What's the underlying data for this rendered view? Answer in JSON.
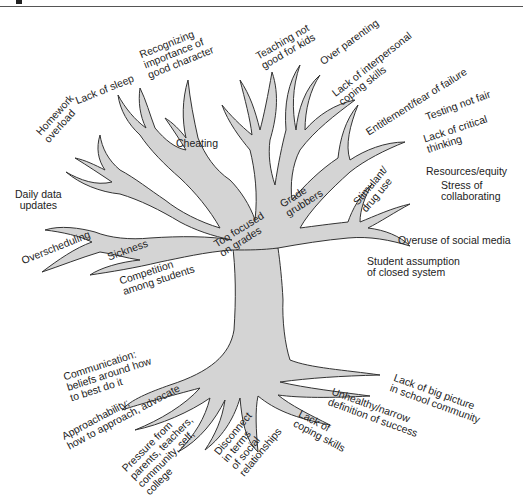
{
  "figure": {
    "caption_visible": false,
    "tree_fill": "#d4d4d4",
    "tree_stroke": "#333333",
    "background": "#ffffff"
  },
  "branches": [
    {
      "id": "homework",
      "text": "Homework\noverload"
    },
    {
      "id": "sleep",
      "text": "Lack of sleep"
    },
    {
      "id": "character",
      "text": "Recognizing\nimportance of\ngood character"
    },
    {
      "id": "cheating",
      "text": "Cheating"
    },
    {
      "id": "teaching",
      "text": "Teaching not\ngood for kids"
    },
    {
      "id": "parenting",
      "text": "Over parenting"
    },
    {
      "id": "interpersonal",
      "text": "Lack of interpersonal\ncoping skills"
    },
    {
      "id": "entitlement",
      "text": "Entitlement/fear of failure"
    },
    {
      "id": "testing",
      "text": "Testing not fair"
    },
    {
      "id": "critical",
      "text": "Lack of critical\nthinking"
    },
    {
      "id": "resources",
      "text": "Resources/equity"
    },
    {
      "id": "collaborating",
      "text": "Stress of\ncollaborating"
    },
    {
      "id": "stimulant",
      "text": "Stimulant/\ndrug use"
    },
    {
      "id": "grubbers",
      "text": "Grade\ngrubbers"
    },
    {
      "id": "grades",
      "text": "Too focused\non grades"
    },
    {
      "id": "daily",
      "text": "Daily data\nupdates"
    },
    {
      "id": "overscheduling",
      "text": "Overscheduling"
    },
    {
      "id": "sickness",
      "text": "Sickness"
    },
    {
      "id": "competition",
      "text": "Competition\namong students"
    },
    {
      "id": "socialmedia",
      "text": "Overuse of social media"
    },
    {
      "id": "closed",
      "text": "Student assumption\nof closed system"
    }
  ],
  "roots": [
    {
      "id": "communication",
      "text": "Communication:\nbeliefs around how\nto best do it"
    },
    {
      "id": "approachability",
      "text": "Approachability;\nhow to approach, advocate"
    },
    {
      "id": "pressure",
      "text": "Pressure from\nparents, teachers,\ncommunity, self,\ncollege"
    },
    {
      "id": "disconnect",
      "text": "Disconnect\nin terms\nof social\nrelationships"
    },
    {
      "id": "coping",
      "text": "Lack of\ncoping skills"
    },
    {
      "id": "unhealthy",
      "text": "Unhealthy/narrow\ndefinition of success"
    },
    {
      "id": "bigpicture",
      "text": "Lack of big picture\nin school community"
    }
  ]
}
